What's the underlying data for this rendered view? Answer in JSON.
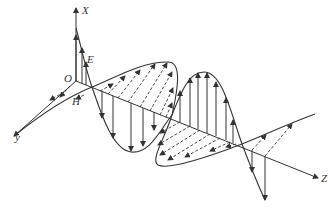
{
  "diagram": {
    "labels": {
      "x_axis": "X",
      "y_axis": "y",
      "z_axis": "Z",
      "origin": "O",
      "electric_field": "E",
      "magnetic_field": "H"
    },
    "colors": {
      "line": "#333333",
      "background": "#ffffff"
    }
  }
}
